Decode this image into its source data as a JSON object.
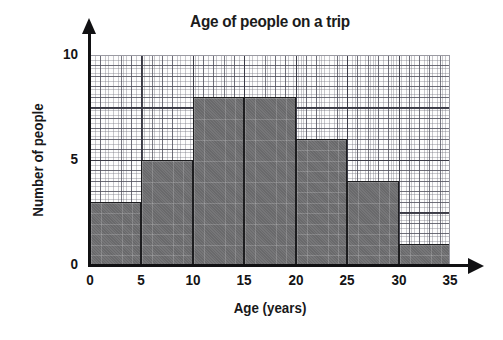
{
  "chart_data": {
    "type": "bar",
    "title": "Age of people on a trip",
    "xlabel": "Age (years)",
    "ylabel": "Number of people",
    "categories": [
      "0-5",
      "5-10",
      "10-15",
      "15-20",
      "20-25",
      "25-30",
      "30-35"
    ],
    "bin_edges": [
      0,
      5,
      10,
      15,
      20,
      25,
      30,
      35
    ],
    "values": [
      3,
      5,
      8,
      8,
      6,
      4,
      1
    ],
    "xlim": [
      0,
      35
    ],
    "ylim": [
      0,
      10
    ],
    "x_ticks": [
      "0",
      "5",
      "10",
      "15",
      "20",
      "25",
      "30",
      "35"
    ],
    "y_ticks": [
      "0",
      "5",
      "10"
    ],
    "grid": true,
    "grid_style": "graph-paper",
    "legend": null,
    "bar_color": "#6f6f71",
    "bar_edge_color": "#1d1d1f",
    "axis_color": "#111113",
    "background_color": "#ffffff"
  },
  "axes": {
    "y_axis_name": "y-axis",
    "x_axis_name": "x-axis",
    "y_arrow": "arrow-up-icon",
    "x_arrow": "arrow-right-icon"
  }
}
